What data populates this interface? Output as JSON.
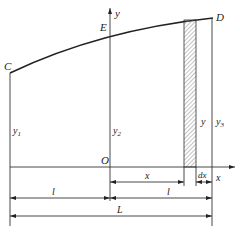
{
  "diagram": {
    "points": {
      "C": "C",
      "E": "E",
      "D": "D",
      "O": "O"
    },
    "axes": {
      "y": "y",
      "x": "x"
    },
    "heights": {
      "y1": "y",
      "y1_sub": "1",
      "y2": "y",
      "y2_sub": "2",
      "y": "y",
      "y3": "y",
      "y3_sub": "3"
    },
    "dimensions": {
      "x": "x",
      "dx": "dx",
      "l_left": "l",
      "l_right": "l",
      "L": "L"
    },
    "colors": {
      "line": "#333333",
      "hatch": "#888888"
    }
  }
}
